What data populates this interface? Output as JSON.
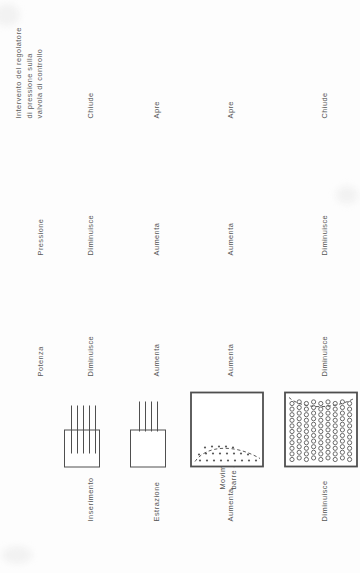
{
  "document": {
    "title": "Intervento del regolatore di pressione sulla valvola di controllo",
    "language": "Italiano",
    "orientation": "rotated-90-ccw"
  },
  "columns": {
    "power": "Potenza",
    "pressure": "Pressione",
    "valve_line1": "Intervento del regolatore",
    "valve_line2": "di pressione sulla",
    "valve_line3": "valvola di controllo"
  },
  "groups": [
    {
      "caption_line1": "Movimento delle",
      "caption_line2": "barre di controllo"
    },
    {
      "caption_line1": "Portata di ricircolo",
      "caption_line2": ""
    }
  ],
  "rows": [
    {
      "action": "Inserimento",
      "power": "Diminuisce",
      "pressure": "Diminuisce",
      "valve": "Chiude",
      "icon": "control-rods-inserted-icon"
    },
    {
      "action": "Estrazione",
      "power": "Aumenta",
      "pressure": "Aumenta",
      "valve": "Apre",
      "icon": "control-rods-withdrawn-icon"
    },
    {
      "action": "Aumenta",
      "power": "Aumenta",
      "pressure": "Aumenta",
      "valve": "Apre",
      "icon": "core-low-void-icon"
    },
    {
      "action": "Diminuisce",
      "power": "Diminuisce",
      "pressure": "Diminuisce",
      "valve": "Chiude",
      "icon": "core-high-void-icon"
    }
  ],
  "colors": {
    "ink": "#4f4f4f",
    "text": "#555555",
    "paper": "#fdfdfd"
  }
}
